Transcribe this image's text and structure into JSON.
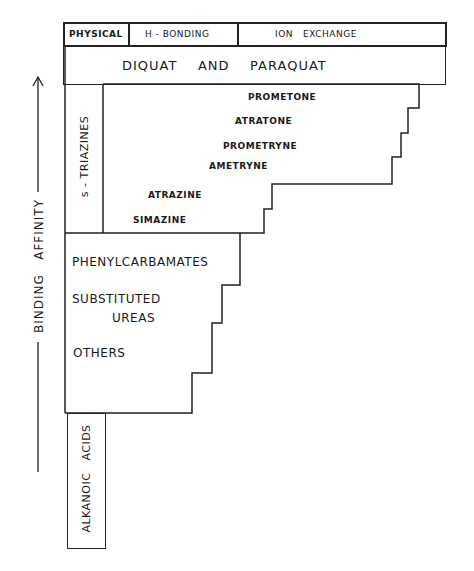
{
  "header": {
    "columns": [
      {
        "label": "PHYSICAL"
      },
      {
        "label": "H - BONDING"
      },
      {
        "label": "ION   EXCHANGE"
      }
    ]
  },
  "top_band": {
    "label": "DIQUAT    AND    PARAQUAT"
  },
  "axis": {
    "label": "BINDING   AFFINITY",
    "direction": "up"
  },
  "groups": {
    "triazines": {
      "label": "s - TRIAZINES",
      "compounds": [
        "PROMETONE",
        "ATRATONE",
        "PROMETRYNE",
        "AMETRYNE",
        "ATRAZINE",
        "SIMAZINE"
      ]
    },
    "middle": {
      "compounds": [
        "PHENYLCARBAMATES",
        "SUBSTITUTED",
        "UREAS",
        "OTHERS"
      ]
    },
    "alkanoic": {
      "label": "ALKANOIC   ACIDS"
    }
  },
  "colors": {
    "line": "#222222",
    "background": "#ffffff"
  }
}
